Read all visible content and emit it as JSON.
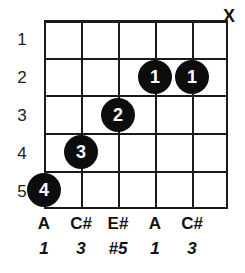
{
  "diagram": {
    "type": "guitar-chord-diagram",
    "string_count": 6,
    "fret_count": 5,
    "fret_numbers": [
      "1",
      "2",
      "3",
      "4",
      "5"
    ],
    "string_markers": [
      {
        "string": 6,
        "symbol": "X",
        "meaning": "muted"
      }
    ],
    "dots": [
      {
        "finger": "4",
        "string": 1,
        "fret": 5
      },
      {
        "finger": "3",
        "string": 2,
        "fret": 4
      },
      {
        "finger": "2",
        "string": 3,
        "fret": 3
      },
      {
        "finger": "1",
        "string": 4,
        "fret": 2
      },
      {
        "finger": "1",
        "string": 5,
        "fret": 2
      }
    ],
    "notes": [
      "A",
      "C#",
      "E#",
      "A",
      "C#"
    ],
    "intervals": [
      "1",
      "3",
      "#5",
      "1",
      "3"
    ],
    "colors": {
      "grid": "#1a1a1a",
      "dot_fill": "#0d0d0d",
      "dot_text": "#ffffff",
      "label_text": "#111111",
      "background": "#ffffff"
    }
  }
}
